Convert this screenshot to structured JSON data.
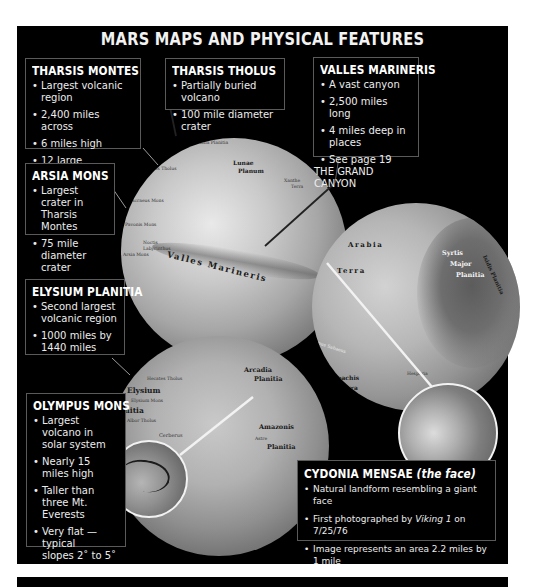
{
  "title": "MARS MAPS AND PHYSICAL FEATURES",
  "colors": {
    "panel": "#000000",
    "text": "#ffffff",
    "box_border": "#5a5a5a",
    "pointer_line": "#f2f2f2",
    "page_bg": "#ffffff"
  },
  "boxes": {
    "tharsis_montes": {
      "heading": "THARSIS MONTES",
      "items": [
        "Largest volcanic region",
        "2,400 miles across",
        "6 miles high",
        "12 large volcanoes"
      ]
    },
    "tharsis_tholus": {
      "heading": "THARSIS THOLUS",
      "items": [
        "Partially buried volcano",
        "100 mile diameter crater"
      ]
    },
    "valles_marineris": {
      "heading": "VALLES MARINERIS",
      "items": [
        "A vast canyon",
        "2,500 miles long",
        "4 miles deep in places"
      ],
      "see_line1": "See page 19",
      "see_line2": "THE GRAND CANYON"
    },
    "arsia_mons": {
      "heading": "ARSIA MONS",
      "items": [
        {
          "l1": "Largest crater in",
          "l2": "Tharsis Montes"
        },
        {
          "l1": "75 mile diameter",
          "l2": "crater"
        }
      ]
    },
    "elysium_planitia": {
      "heading": "ELYSIUM PLANITIA",
      "items": [
        {
          "l1": "Second largest",
          "l2": "volcanic region"
        },
        {
          "l1": "1000 miles by",
          "l2": "1440 miles"
        }
      ]
    },
    "olympus_mons": {
      "heading": "OLYMPUS MONS",
      "items": [
        {
          "l1": "Largest",
          "l2": "volcano in",
          "l3": "solar system"
        },
        {
          "l1": "Nearly 15",
          "l2": "miles high"
        },
        {
          "l1": "Taller than",
          "l2": "three Mt. Everests"
        },
        {
          "l1": "Very flat —typical",
          "l2": "slopes 2˚ to 5˚"
        }
      ]
    },
    "cydonia_mensae": {
      "heading": "CYDONIA MENSAE",
      "heading_sub": "(the face)",
      "item1": "Natural landform resembling a giant face",
      "item2_pre": "First photographed by ",
      "item2_em": "Viking 1",
      "item2_post": " on 7/25/76",
      "item3": "Image represents an area 2.2 miles by 1 mile"
    }
  },
  "globe_tharsis": {
    "labels": {
      "tharsis_tholus": "Tharsis Tholus",
      "ascraeus_mons": "Ascraeus Mons",
      "pavonis_mons": "Pavonis Mons",
      "noctis": "Noctis",
      "labyrinthus": "Labyrinthus",
      "arsia": "Arsia Mons",
      "lunae": "Lunae",
      "planum": "Planum",
      "xanthe": "Xanthe",
      "terra": "Terra",
      "valles": "Valles Marineris",
      "rim": "Acidalia Planitia"
    }
  },
  "globe_syrtis": {
    "labels": {
      "arabia": "Arabia",
      "terra": "Terra",
      "syrtis": "Syrtis",
      "major": "Major",
      "planitia": "Planitia",
      "isidis": "Isidis Planitia",
      "sinus": "Sinus Sabaeus",
      "noachis": "Noachis",
      "noachis_terra": "Terra",
      "hellas": "Hellas",
      "hesperia": "Hesperia"
    }
  },
  "globe_olympus": {
    "labels": {
      "hecates": "Hecates Tholus",
      "elysium": "Elysium",
      "elysium_mons": "Elysium Mons",
      "planitia": "Planitia",
      "albor": "Albor Tholus",
      "cerberus": "Cerberus",
      "arcadia": "Arcadia",
      "arcadia_planitia": "Planitia",
      "amazonis": "Amazonis",
      "amazonis_planitia": "Planitia",
      "astre": "Astre"
    }
  }
}
